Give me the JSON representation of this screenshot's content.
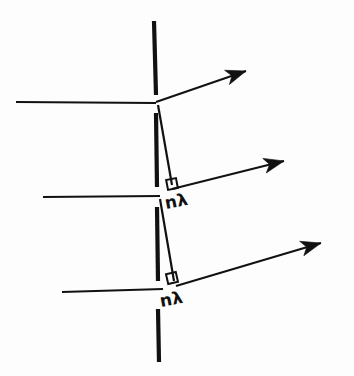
{
  "diagram": {
    "canvas": {
      "width": 354,
      "height": 376,
      "background": "#fdfdfd"
    },
    "ink_color": "#111111",
    "labels": [
      {
        "id": "path-difference-upper",
        "text": "nλ",
        "x": 166,
        "y": 209,
        "rotate": -11,
        "size": 17
      },
      {
        "id": "path-difference-lower",
        "text": "nλ",
        "x": 161,
        "y": 307,
        "rotate": -11,
        "size": 17
      }
    ],
    "plane_normals": [
      {
        "id": "normal-dash-top",
        "x1": 154,
        "y1": 21,
        "x2": 156,
        "y2": 95,
        "width": 4.2
      },
      {
        "id": "normal-dash-middle",
        "x1": 156,
        "y1": 113,
        "x2": 157,
        "y2": 187,
        "width": 4.2
      },
      {
        "id": "normal-dash-lower",
        "x1": 157,
        "y1": 207,
        "x2": 158,
        "y2": 281,
        "width": 4.2
      },
      {
        "id": "normal-dash-bottom",
        "x1": 158,
        "y1": 309,
        "x2": 159,
        "y2": 362,
        "width": 4.2
      }
    ],
    "incident_rays": [
      {
        "id": "incident-ray-top",
        "x1": 16,
        "y1": 102,
        "x2": 156,
        "y2": 103,
        "width": 2.0
      },
      {
        "id": "incident-ray-middle",
        "x1": 43,
        "y1": 197,
        "x2": 160,
        "y2": 196,
        "width": 2.0
      },
      {
        "id": "incident-ray-bottom",
        "x1": 62,
        "y1": 292,
        "x2": 163,
        "y2": 289,
        "width": 2.0
      }
    ],
    "diffracted_rays": [
      {
        "id": "diffracted-ray-top",
        "x1": 156,
        "y1": 102,
        "x2": 236,
        "y2": 75,
        "tip_x": 246,
        "tip_y": 71,
        "width": 2.0
      },
      {
        "id": "diffracted-ray-middle",
        "x1": 172,
        "y1": 189,
        "x2": 272,
        "y2": 165,
        "tip_x": 284,
        "tip_y": 161,
        "width": 2.0
      },
      {
        "id": "diffracted-ray-bottom",
        "x1": 176,
        "y1": 286,
        "x2": 308,
        "y2": 248,
        "tip_x": 321,
        "tip_y": 243,
        "width": 2.0
      }
    ],
    "path_difference_segments": [
      {
        "id": "path-segment-upper",
        "x1": 158,
        "y1": 105,
        "x2": 172,
        "y2": 185,
        "width": 2.2
      },
      {
        "id": "path-segment-lower",
        "x1": 160,
        "y1": 199,
        "x2": 174,
        "y2": 281,
        "width": 2.2
      }
    ],
    "right_angle_marks": [
      {
        "id": "right-angle-upper",
        "x": 167,
        "y": 179,
        "size": 10,
        "rotate": -11
      },
      {
        "id": "right-angle-lower",
        "x": 167,
        "y": 273,
        "size": 10,
        "rotate": -13
      }
    ],
    "arrowheads": [
      {
        "id": "arrowhead-top",
        "tip_x": 246,
        "tip_y": 71,
        "angle": -18.6
      },
      {
        "id": "arrowhead-middle",
        "tip_x": 284,
        "tip_y": 161,
        "angle": -13.5
      },
      {
        "id": "arrowhead-bottom",
        "tip_x": 321,
        "tip_y": 243,
        "angle": -16.0
      }
    ]
  }
}
